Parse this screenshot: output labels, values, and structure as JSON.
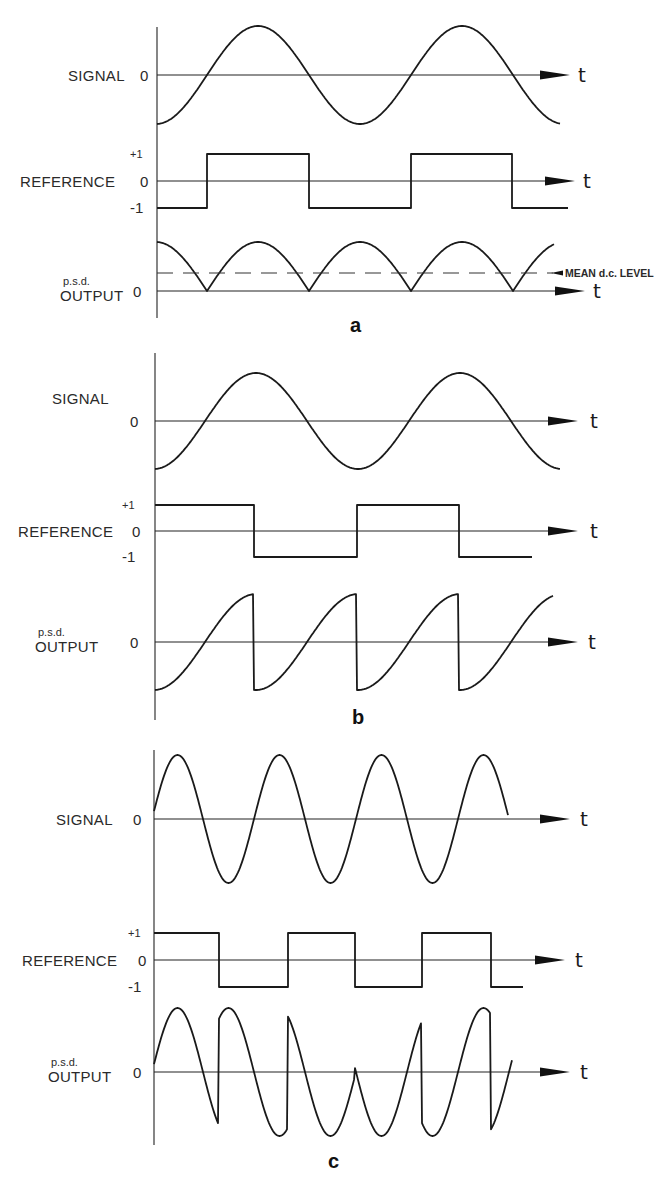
{
  "figure": {
    "panels": [
      {
        "id": "a",
        "label": "a",
        "label_pos": [
          350,
          332
        ],
        "axis_x": 157,
        "axis_top": 27,
        "axis_bottom": 318,
        "rows": [
          {
            "name": "signal",
            "title": "SIGNAL",
            "title_pos": [
              68,
              81
            ],
            "zero_label": "0",
            "zero_label_x": 140,
            "zero_y": 75,
            "amp": 49,
            "arrow_end": 570,
            "t_label": "t",
            "t_x": 578,
            "kind": "sine",
            "x_start": 157,
            "x_end": 560,
            "period": 204,
            "phase_x": 207,
            "sign": 1
          },
          {
            "name": "reference",
            "title": "REFERENCE",
            "title_pos": [
              20,
              187
            ],
            "plus_label": "+1",
            "minus_label": "-1",
            "zero_label": "0",
            "zero_label_x": 140,
            "zero_y": 181,
            "amp": 27,
            "arrow_end": 575,
            "t_label": "t",
            "t_x": 583,
            "kind": "square",
            "x_start": 157,
            "x_end": 568,
            "start_level": -1,
            "edges": [
              207,
              309,
              411,
              512
            ]
          },
          {
            "name": "psd-output",
            "title": "OUTPUT",
            "subtitle": "p.s.d.",
            "title_pos": [
              60,
              301
            ],
            "zero_label": "0",
            "zero_label_x": 133,
            "zero_y": 291,
            "amp": 49,
            "arrow_end": 585,
            "t_label": "t",
            "t_x": 593,
            "kind": "rectified",
            "x_start": 157,
            "x_end": 554,
            "period": 204,
            "phase_x": 207,
            "mean_y": 273,
            "mean_label": "MEAN d.c. LEVEL",
            "mean_label_x": 565
          }
        ]
      },
      {
        "id": "b",
        "label": "b",
        "label_pos": [
          352,
          724
        ],
        "axis_x": 155,
        "axis_top": 353,
        "axis_bottom": 720,
        "rows": [
          {
            "name": "signal",
            "title": "SIGNAL",
            "title_pos": [
              52,
              404
            ],
            "zero_label": "0",
            "zero_label_x": 130,
            "zero_y": 421,
            "amp": 48,
            "arrow_end": 578,
            "t_label": "t",
            "t_x": 590,
            "kind": "sine",
            "x_start": 155,
            "x_end": 560,
            "period": 204,
            "phase_x": 205,
            "sign": 1
          },
          {
            "name": "reference",
            "title": "REFERENCE",
            "title_pos": [
              18,
              537
            ],
            "plus_label": "+1",
            "minus_label": "-1",
            "zero_label": "0",
            "zero_label_x": 132,
            "zero_y": 531,
            "amp": 26,
            "arrow_end": 578,
            "t_label": "t",
            "t_x": 590,
            "kind": "square",
            "x_start": 155,
            "x_end": 532,
            "start_level": 1,
            "edges": [
              254,
              357,
              459
            ]
          },
          {
            "name": "psd-output",
            "title": "OUTPUT",
            "subtitle": "p.s.d.",
            "title_pos": [
              35,
              652
            ],
            "zero_label": "0",
            "zero_label_x": 130,
            "zero_y": 642,
            "amp": 48,
            "arrow_end": 578,
            "t_label": "t",
            "t_x": 588,
            "kind": "product",
            "x_start": 155,
            "x_end": 553,
            "period": 204,
            "phase_x": 205,
            "ref_start_level": 1,
            "ref_edges": [
              254,
              357,
              459
            ]
          }
        ]
      },
      {
        "id": "c",
        "label": "c",
        "label_pos": [
          328,
          1168
        ],
        "axis_x": 154,
        "axis_top": 750,
        "axis_bottom": 1145,
        "rows": [
          {
            "name": "signal",
            "title": "SIGNAL",
            "title_pos": [
              56,
              825
            ],
            "zero_label": "0",
            "zero_label_x": 133,
            "zero_y": 819,
            "amp": 64,
            "arrow_end": 570,
            "t_label": "t",
            "t_x": 580,
            "kind": "sine",
            "x_start": 154,
            "x_end": 508,
            "period": 102,
            "phase_x": 152,
            "sign": 1
          },
          {
            "name": "reference",
            "title": "REFERENCE",
            "title_pos": [
              22,
              966
            ],
            "plus_label": "+1",
            "minus_label": "-1",
            "zero_label": "0",
            "zero_label_x": 138,
            "zero_y": 960,
            "amp": 27,
            "arrow_end": 565,
            "t_label": "t",
            "t_x": 575,
            "kind": "square",
            "x_start": 154,
            "x_end": 523,
            "start_level": 1,
            "edges": [
              219,
              288,
              355,
              422,
              491
            ]
          },
          {
            "name": "psd-output",
            "title": "OUTPUT",
            "subtitle": "p.s.d.",
            "title_pos": [
              48,
              1082
            ],
            "zero_label": "0",
            "zero_label_x": 133,
            "zero_y": 1072,
            "amp": 64,
            "arrow_end": 570,
            "t_label": "t",
            "t_x": 580,
            "kind": "product",
            "x_start": 154,
            "x_end": 512,
            "period": 102,
            "phase_x": 152,
            "ref_start_level": 1,
            "ref_edges": [
              219,
              288,
              355,
              422,
              491
            ]
          }
        ]
      }
    ]
  }
}
